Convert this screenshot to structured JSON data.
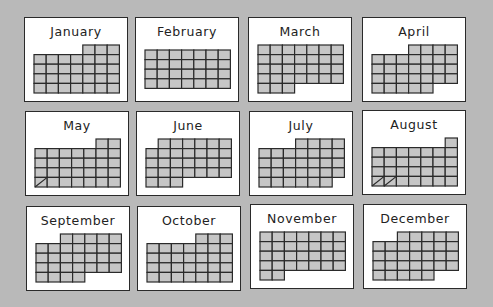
{
  "colors": {
    "background": "#b9b9b9",
    "card": "#ffffff",
    "cell_fill": "#c6c6c6",
    "cell_border": "#2a2a2a"
  },
  "months": [
    {
      "name": "January",
      "start_col": 4,
      "days": 31,
      "split_cells": 0
    },
    {
      "name": "February",
      "start_col": 0,
      "days": 28,
      "split_cells": 0
    },
    {
      "name": "March",
      "start_col": 0,
      "days": 31,
      "split_cells": 0
    },
    {
      "name": "April",
      "start_col": 3,
      "days": 30,
      "split_cells": 0
    },
    {
      "name": "May",
      "start_col": 5,
      "days": 31,
      "split_cells": 1
    },
    {
      "name": "June",
      "start_col": 1,
      "days": 30,
      "split_cells": 0
    },
    {
      "name": "July",
      "start_col": 3,
      "days": 31,
      "split_cells": 0
    },
    {
      "name": "August",
      "start_col": 6,
      "days": 31,
      "split_cells": 2
    },
    {
      "name": "September",
      "start_col": 2,
      "days": 30,
      "split_cells": 0
    },
    {
      "name": "October",
      "start_col": 4,
      "days": 31,
      "split_cells": 0
    },
    {
      "name": "November",
      "start_col": 0,
      "days": 30,
      "split_cells": 0
    },
    {
      "name": "December",
      "start_col": 2,
      "days": 31,
      "split_cells": 0
    }
  ]
}
